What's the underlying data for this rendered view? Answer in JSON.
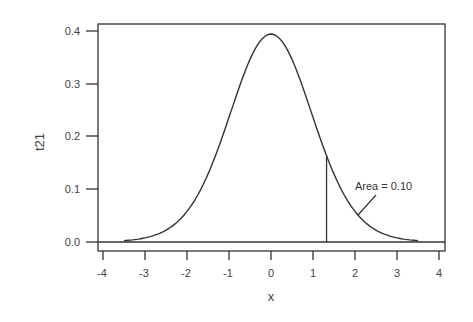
{
  "chart_data": {
    "type": "line",
    "title": "",
    "xlabel": "x",
    "ylabel": "t21",
    "xlim": [
      -4.2,
      4.2
    ],
    "ylim": [
      -0.02,
      0.42
    ],
    "grid": false,
    "legend": null,
    "x_ticks": [
      -4,
      -3,
      -2,
      -1,
      0,
      1,
      2,
      3,
      4
    ],
    "y_ticks": [
      "0.0",
      "0.1",
      "0.2",
      "0.3",
      "0.4"
    ],
    "distribution": "Student t, df = 21",
    "x_range_plotted": [
      -3.5,
      3.5
    ],
    "series": [
      {
        "name": "t21 density",
        "x": [
          -3.5,
          -3.0,
          -2.5,
          -2.0,
          -1.5,
          -1.0,
          -0.5,
          0.0,
          0.5,
          1.0,
          1.5,
          2.0,
          2.5,
          3.0,
          3.5
        ],
        "values": [
          0.002,
          0.006,
          0.019,
          0.056,
          0.129,
          0.237,
          0.348,
          0.394,
          0.348,
          0.237,
          0.129,
          0.056,
          0.019,
          0.006,
          0.002
        ]
      }
    ],
    "annotations": [
      {
        "type": "vline",
        "x": 1.323,
        "y_top": 0.163,
        "label": ""
      },
      {
        "type": "text",
        "text": "Area = 0.10",
        "x": 2.0,
        "y": 0.1,
        "points_to": {
          "x": 1.9,
          "y": 0.055
        }
      }
    ]
  },
  "axes": {
    "xlabel": "x",
    "ylabel": "t21",
    "x_tick_labels": [
      "-4",
      "-3",
      "-2",
      "-1",
      "0",
      "1",
      "2",
      "3",
      "4"
    ],
    "y_tick_labels": [
      "0.0",
      "0.1",
      "0.2",
      "0.3",
      "0.4"
    ]
  },
  "annotation": {
    "text": "Area = 0.10"
  }
}
